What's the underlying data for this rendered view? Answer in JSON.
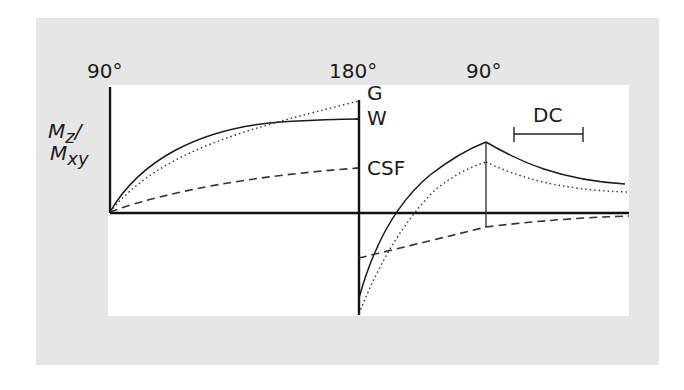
{
  "diagram": {
    "pulse_labels": [
      "90°",
      "180°",
      "90°"
    ],
    "y_axis_label": {
      "line1_main": "M",
      "line1_sub": "z",
      "line1_suffix": "/",
      "line2_main": "M",
      "line2_sub": "xy"
    },
    "tissue_labels": {
      "gray_matter": "G",
      "white_matter": "W",
      "csf": "CSF"
    },
    "interval_label": "DC",
    "colors": {
      "background_panel": "#e6e6e6",
      "plot_area": "#ffffff",
      "line": "#1a1a1a"
    },
    "curves": [
      {
        "name": "W (white matter)",
        "style": "solid"
      },
      {
        "name": "G (gray matter)",
        "style": "dotted"
      },
      {
        "name": "CSF",
        "style": "dashed"
      }
    ]
  }
}
